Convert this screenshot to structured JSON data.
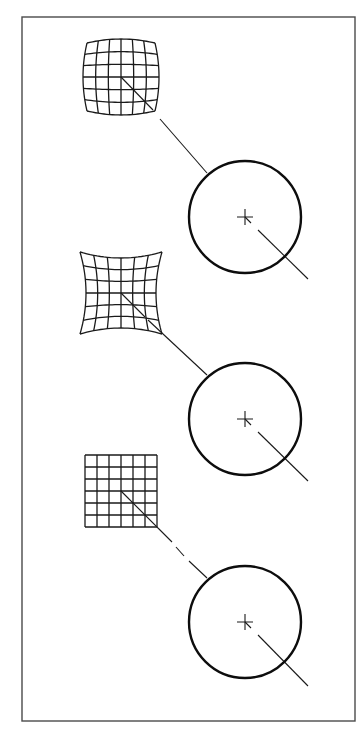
{
  "figure": {
    "frame": {
      "x": 22,
      "y": 17,
      "width": 333,
      "height": 704
    },
    "colors": {
      "stroke": "#1a1a1a",
      "frame": "#4a4a4a",
      "background": "#ffffff"
    },
    "panels": [
      {
        "id": "barrel",
        "distortion": "barrel",
        "grid": {
          "cells": 6,
          "cx": 121,
          "cy": 77,
          "half": 34,
          "bulge": 4
        },
        "circle": {
          "cx": 245,
          "cy": 217,
          "r": 56
        },
        "ray_segments": [
          [
            [
              121,
              77
            ],
            [
              153,
              110
            ]
          ],
          [
            [
              160,
              119
            ],
            [
              207,
              173
            ]
          ],
          [
            [
              245,
              217
            ],
            [
              251,
              223
            ]
          ],
          [
            [
              258,
              230
            ],
            [
              308,
              279
            ]
          ]
        ]
      },
      {
        "id": "pincushion",
        "distortion": "pincushion",
        "grid": {
          "cells": 6,
          "cx": 121,
          "cy": 293,
          "half": 41,
          "bulge": -6
        },
        "circle": {
          "cx": 245,
          "cy": 419,
          "r": 56
        },
        "ray_segments": [
          [
            [
              121,
              293
            ],
            [
              145,
              317
            ]
          ],
          [
            [
              148,
              320
            ],
            [
              207,
              375
            ]
          ],
          [
            [
              245,
              419
            ],
            [
              251,
              425
            ]
          ],
          [
            [
              258,
              432
            ],
            [
              308,
              481
            ]
          ]
        ]
      },
      {
        "id": "undistorted",
        "distortion": "none",
        "grid": {
          "cells": 6,
          "cx": 121,
          "cy": 491,
          "half": 36,
          "bulge": 0
        },
        "circle": {
          "cx": 245,
          "cy": 622,
          "r": 56
        },
        "ray_segments": [
          [
            [
              121,
              491
            ],
            [
              172,
              542
            ]
          ],
          [
            [
              176,
              547
            ],
            [
              184,
              556
            ]
          ],
          [
            [
              189,
              561
            ],
            [
              207,
              578
            ]
          ],
          [
            [
              245,
              622
            ],
            [
              251,
              628
            ]
          ],
          [
            [
              258,
              635
            ],
            [
              308,
              686
            ]
          ]
        ]
      }
    ],
    "crosshair_size": 8
  }
}
